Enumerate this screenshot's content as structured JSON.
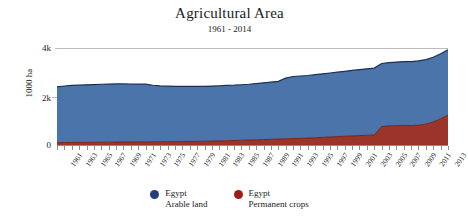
{
  "chart_data": {
    "type": "area",
    "stacked": true,
    "title": "Agricultural Area",
    "subtitle": "1961 - 2014",
    "xlabel": "",
    "ylabel": "1000 ha",
    "ylim": [
      0,
      4000
    ],
    "xlim": [
      1961,
      2014
    ],
    "grid": "horizontal-top-only",
    "legend_position": "bottom-center",
    "y_ticks": [
      {
        "value": 0,
        "label": "0"
      },
      {
        "value": 2000,
        "label": "2k"
      },
      {
        "value": 4000,
        "label": "4k"
      }
    ],
    "x_tick_labels": [
      "1961",
      "1963",
      "1965",
      "1967",
      "1969",
      "1971",
      "1973",
      "1975",
      "1977",
      "1979",
      "1981",
      "1983",
      "1985",
      "1987",
      "1989",
      "1991",
      "1993",
      "1995",
      "1997",
      "1999",
      "2001",
      "2003",
      "2005",
      "2007",
      "2009",
      "2011",
      "2013"
    ],
    "x": [
      1961,
      1962,
      1963,
      1964,
      1965,
      1966,
      1967,
      1968,
      1969,
      1970,
      1971,
      1972,
      1973,
      1974,
      1975,
      1976,
      1977,
      1978,
      1979,
      1980,
      1981,
      1982,
      1983,
      1984,
      1985,
      1986,
      1987,
      1988,
      1989,
      1990,
      1991,
      1992,
      1993,
      1994,
      1995,
      1996,
      1997,
      1998,
      1999,
      2000,
      2001,
      2002,
      2003,
      2004,
      2005,
      2006,
      2007,
      2008,
      2009,
      2010,
      2011,
      2012,
      2013,
      2014
    ],
    "series": [
      {
        "name": "Egypt Arable land",
        "legend_name": "Egypt",
        "legend_sub": "Arable land",
        "color": "#4a74aa",
        "stroke": "#1c3054",
        "values": [
          2300,
          2330,
          2350,
          2360,
          2370,
          2380,
          2390,
          2395,
          2400,
          2395,
          2390,
          2385,
          2380,
          2330,
          2300,
          2290,
          2280,
          2275,
          2270,
          2265,
          2260,
          2270,
          2275,
          2280,
          2280,
          2290,
          2300,
          2320,
          2340,
          2360,
          2380,
          2500,
          2560,
          2570,
          2580,
          2600,
          2620,
          2640,
          2660,
          2680,
          2700,
          2720,
          2740,
          2760,
          2600,
          2610,
          2620,
          2630,
          2640,
          2650,
          2660,
          2670,
          2680,
          2700
        ]
      },
      {
        "name": "Egypt Permanent crops",
        "legend_name": "Egypt",
        "legend_sub": "Permanent crops",
        "color": "#9c3529",
        "stroke": "#6b1f16",
        "values": [
          100,
          102,
          105,
          107,
          110,
          112,
          115,
          118,
          120,
          122,
          125,
          128,
          130,
          133,
          135,
          138,
          140,
          143,
          145,
          150,
          155,
          160,
          168,
          175,
          185,
          195,
          205,
          215,
          225,
          235,
          245,
          255,
          265,
          275,
          285,
          300,
          315,
          330,
          345,
          360,
          375,
          390,
          400,
          410,
          760,
          790,
          800,
          810,
          800,
          820,
          860,
          950,
          1080,
          1230
        ]
      }
    ],
    "totals": [
      2400,
      2432,
      2455,
      2467,
      2480,
      2492,
      2505,
      2513,
      2520,
      2517,
      2515,
      2513,
      2510,
      2463,
      2435,
      2428,
      2420,
      2418,
      2415,
      2415,
      2415,
      2430,
      2443,
      2455,
      2465,
      2485,
      2505,
      2535,
      2565,
      2595,
      2625,
      2755,
      2825,
      2845,
      2865,
      2900,
      2935,
      2970,
      3005,
      3040,
      3075,
      3110,
      3140,
      3170,
      3360,
      3400,
      3420,
      3440,
      3440,
      3470,
      3520,
      3620,
      3760,
      3930
    ]
  },
  "legend": {
    "items": [
      {
        "name": "Egypt",
        "sub": "Arable land",
        "color": "#243f78"
      },
      {
        "name": "Egypt",
        "sub": "Permanent crops",
        "color": "#9c1d16"
      }
    ]
  }
}
